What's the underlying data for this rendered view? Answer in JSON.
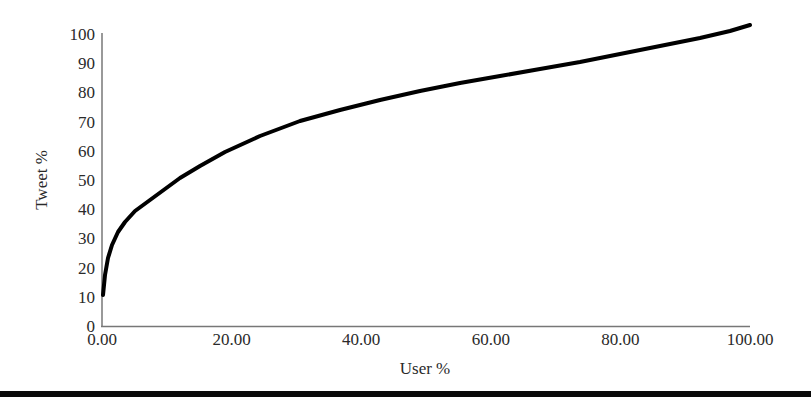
{
  "chart_data": {
    "type": "line",
    "title": "",
    "xlabel": "User %",
    "ylabel": "Tweet %",
    "xlim": [
      0,
      100
    ],
    "ylim": [
      0,
      100
    ],
    "grid": false,
    "legend": null,
    "x_ticks": [
      "0.00",
      "20.00",
      "40.00",
      "60.00",
      "80.00",
      "100.00"
    ],
    "y_ticks": [
      "0",
      "10",
      "20",
      "30",
      "40",
      "50",
      "60",
      "70",
      "80",
      "90",
      "100"
    ],
    "series": [
      {
        "name": "Cumulative tweet share",
        "color": "#000000",
        "x": [
          0,
          0.5,
          1,
          2,
          3,
          4,
          5,
          7.5,
          10,
          12.5,
          15,
          20,
          25,
          30,
          35,
          40,
          45,
          50,
          55,
          60,
          65,
          70,
          75,
          80,
          85,
          90,
          95,
          100
        ],
        "y": [
          10.6,
          22.5,
          26.9,
          32.1,
          35.7,
          38.4,
          40.7,
          45.1,
          48.6,
          51.5,
          54.1,
          58.5,
          62.3,
          65.6,
          68.6,
          71.3,
          73.9,
          76.2,
          78.4,
          80.5,
          82.4,
          84.3,
          86.1,
          87.8,
          89.4,
          91.0,
          92.4,
          93.9
        ]
      }
    ],
    "annotation": "Curve rises steeply near 0 and ends slightly above 100 at x=100 (≈103)"
  },
  "plot_area": {
    "x0": 102,
    "x1": 750,
    "y0": 326,
    "y1": 34
  },
  "curve_pixels": [
    [
      103,
      295
    ],
    [
      105,
      275
    ],
    [
      108,
      258
    ],
    [
      112,
      245
    ],
    [
      118,
      232
    ],
    [
      125,
      222
    ],
    [
      135,
      211
    ],
    [
      150,
      200
    ],
    [
      165,
      189
    ],
    [
      180,
      178
    ],
    [
      200,
      166
    ],
    [
      225,
      152
    ],
    [
      260,
      136
    ],
    [
      300,
      121
    ],
    [
      340,
      110
    ],
    [
      380,
      100
    ],
    [
      420,
      91
    ],
    [
      460,
      83
    ],
    [
      500,
      76
    ],
    [
      540,
      69
    ],
    [
      580,
      62
    ],
    [
      620,
      54
    ],
    [
      660,
      46
    ],
    [
      700,
      38
    ],
    [
      730,
      31
    ],
    [
      750,
      25
    ]
  ]
}
